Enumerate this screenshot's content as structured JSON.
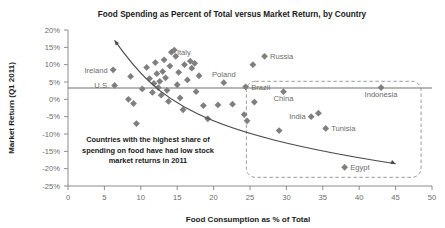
{
  "chart_data": {
    "type": "scatter",
    "title": "Food Spending as Percent of Total versus Market Return, by Country",
    "xlabel": "Food Consumption as % of Total",
    "ylabel": "Market Return (Q1 2011)",
    "xlim": [
      0,
      50
    ],
    "ylim": [
      -25,
      20
    ],
    "xticks": [
      0,
      5,
      10,
      15,
      20,
      25,
      30,
      35,
      40,
      45,
      50
    ],
    "yticks": [
      20,
      15,
      10,
      5,
      0,
      -5,
      -10,
      -15,
      -20,
      -25
    ],
    "xtick_labels": [
      "0",
      "5",
      "10",
      "15",
      "20",
      "25",
      "30",
      "35",
      "40",
      "45",
      "50"
    ],
    "ytick_labels": [
      "20%",
      "15%",
      "10%",
      "5%",
      "0%",
      "-5%",
      "-10%",
      "-15%",
      "-20%",
      "-25%"
    ],
    "grid": false,
    "legend": "none",
    "marker_shape": "diamond",
    "marker_color": "#7f7f7f",
    "points": [
      {
        "x": 6.2,
        "y": 8.5,
        "label": "Ireland",
        "label_pos": "left"
      },
      {
        "x": 6.4,
        "y": 4.0,
        "label": "U.S.",
        "label_pos": "left"
      },
      {
        "x": 8.6,
        "y": 6.6,
        "label": "",
        "label_pos": ""
      },
      {
        "x": 8.3,
        "y": 0.0,
        "label": "",
        "label_pos": ""
      },
      {
        "x": 9.0,
        "y": -1.2,
        "label": "",
        "label_pos": ""
      },
      {
        "x": 9.4,
        "y": -7.0,
        "label": "",
        "label_pos": ""
      },
      {
        "x": 10.2,
        "y": 3.0,
        "label": "",
        "label_pos": ""
      },
      {
        "x": 10.8,
        "y": 9.2,
        "label": "",
        "label_pos": ""
      },
      {
        "x": 11.2,
        "y": 6.0,
        "label": "",
        "label_pos": ""
      },
      {
        "x": 11.6,
        "y": 2.0,
        "label": "",
        "label_pos": ""
      },
      {
        "x": 11.8,
        "y": 4.6,
        "label": "",
        "label_pos": ""
      },
      {
        "x": 12.0,
        "y": 10.6,
        "label": "",
        "label_pos": ""
      },
      {
        "x": 12.2,
        "y": 7.4,
        "label": "",
        "label_pos": ""
      },
      {
        "x": 12.4,
        "y": 3.4,
        "label": "",
        "label_pos": ""
      },
      {
        "x": 12.6,
        "y": 5.2,
        "label": "",
        "label_pos": ""
      },
      {
        "x": 12.8,
        "y": 1.2,
        "label": "",
        "label_pos": ""
      },
      {
        "x": 13.0,
        "y": 8.0,
        "label": "",
        "label_pos": ""
      },
      {
        "x": 13.2,
        "y": 11.4,
        "label": "",
        "label_pos": ""
      },
      {
        "x": 13.4,
        "y": 6.2,
        "label": "",
        "label_pos": ""
      },
      {
        "x": 13.6,
        "y": 2.6,
        "label": "",
        "label_pos": ""
      },
      {
        "x": 13.8,
        "y": -0.6,
        "label": "",
        "label_pos": ""
      },
      {
        "x": 14.0,
        "y": 9.6,
        "label": "",
        "label_pos": ""
      },
      {
        "x": 14.2,
        "y": 13.6,
        "label": "Italy",
        "label_pos": "right"
      },
      {
        "x": 14.6,
        "y": 14.2,
        "label": "",
        "label_pos": ""
      },
      {
        "x": 14.8,
        "y": 12.4,
        "label": "",
        "label_pos": ""
      },
      {
        "x": 15.0,
        "y": 4.2,
        "label": "",
        "label_pos": ""
      },
      {
        "x": 15.2,
        "y": 7.8,
        "label": "",
        "label_pos": ""
      },
      {
        "x": 15.4,
        "y": 0.4,
        "label": "",
        "label_pos": ""
      },
      {
        "x": 15.8,
        "y": -3.0,
        "label": "",
        "label_pos": ""
      },
      {
        "x": 16.0,
        "y": 10.0,
        "label": "",
        "label_pos": ""
      },
      {
        "x": 16.4,
        "y": 5.6,
        "label": "",
        "label_pos": ""
      },
      {
        "x": 16.8,
        "y": 11.0,
        "label": "",
        "label_pos": ""
      },
      {
        "x": 17.0,
        "y": 9.0,
        "label": "",
        "label_pos": ""
      },
      {
        "x": 17.4,
        "y": 10.4,
        "label": "",
        "label_pos": ""
      },
      {
        "x": 17.6,
        "y": 2.2,
        "label": "",
        "label_pos": ""
      },
      {
        "x": 18.0,
        "y": 6.8,
        "label": "",
        "label_pos": ""
      },
      {
        "x": 18.6,
        "y": -1.8,
        "label": "",
        "label_pos": ""
      },
      {
        "x": 19.2,
        "y": -5.6,
        "label": "",
        "label_pos": ""
      },
      {
        "x": 20.6,
        "y": -1.6,
        "label": "",
        "label_pos": ""
      },
      {
        "x": 21.4,
        "y": 4.8,
        "label": "Poland",
        "label_pos": "above"
      },
      {
        "x": 22.6,
        "y": -1.4,
        "label": "",
        "label_pos": ""
      },
      {
        "x": 24.4,
        "y": 3.6,
        "label": "Brazil",
        "label_pos": "right"
      },
      {
        "x": 24.2,
        "y": -4.4,
        "label": "",
        "label_pos": ""
      },
      {
        "x": 24.6,
        "y": -6.2,
        "label": "",
        "label_pos": ""
      },
      {
        "x": 25.6,
        "y": -0.8,
        "label": "",
        "label_pos": ""
      },
      {
        "x": 27.0,
        "y": 12.4,
        "label": "Russia",
        "label_pos": "right"
      },
      {
        "x": 25.4,
        "y": 10.0,
        "label": "",
        "label_pos": ""
      },
      {
        "x": 29.6,
        "y": 2.2,
        "label": "China",
        "label_pos": "below"
      },
      {
        "x": 29.0,
        "y": -9.0,
        "label": "",
        "label_pos": ""
      },
      {
        "x": 33.4,
        "y": -5.0,
        "label": "India",
        "label_pos": "left"
      },
      {
        "x": 34.4,
        "y": -4.0,
        "label": "",
        "label_pos": ""
      },
      {
        "x": 35.4,
        "y": -8.4,
        "label": "Tunisia",
        "label_pos": "right"
      },
      {
        "x": 38.0,
        "y": -19.6,
        "label": "Egypt",
        "label_pos": "right"
      },
      {
        "x": 43.0,
        "y": 3.4,
        "label": "Indonesia",
        "label_pos": "below"
      }
    ],
    "trend": {
      "description": "downward curved trend arrow",
      "start": [
        6.4,
        17.0
      ],
      "end": [
        45.0,
        -18.6
      ],
      "arrow_start": true,
      "arrow_end": true
    },
    "highlight_box": {
      "x_range": [
        24.5,
        48.5
      ],
      "y_range": [
        -22.5,
        5.2
      ]
    },
    "annotation": {
      "lines": [
        "Countries with the highest share of",
        "spending on food have had low stock",
        "market returns in 2011"
      ]
    }
  }
}
